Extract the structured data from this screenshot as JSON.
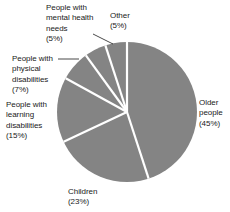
{
  "chart_data": {
    "type": "pie",
    "title": "",
    "subtitle": "",
    "xlabel": "",
    "ylabel": "",
    "legend_position": "none",
    "grid": false,
    "start_angle_deg": 0,
    "direction": "clockwise",
    "slice_fill_color": "#848484",
    "slice_separator_color": "#ffffff",
    "label_text_color": "#1a1a1a",
    "categories": [
      "Older people",
      "Children",
      "People with learning disabilities",
      "People with physical disabilities",
      "People with mental health needs",
      "Other"
    ],
    "values": [
      45,
      23,
      15,
      7,
      5,
      5
    ],
    "unit": "%",
    "slices": [
      {
        "name": "Older people",
        "value": 45,
        "value_label": "(45%)",
        "label_lines": [
          "Older",
          "people",
          "(45%)"
        ]
      },
      {
        "name": "Children",
        "value": 23,
        "value_label": "(23%)",
        "label_lines": [
          "Children",
          "(23%)"
        ]
      },
      {
        "name": "People with learning disabilities",
        "value": 15,
        "value_label": "(15%)",
        "label_lines": [
          "People with",
          "learning",
          "disabilities",
          "(15%)"
        ]
      },
      {
        "name": "People with physical disabilities",
        "value": 7,
        "value_label": "(7%)",
        "label_lines": [
          "People with",
          "physical",
          "disabilities",
          "(7%)"
        ]
      },
      {
        "name": "People with mental health needs",
        "value": 5,
        "value_label": "(5%)",
        "label_lines": [
          "People with",
          "mental health",
          "needs",
          "(5%)"
        ]
      },
      {
        "name": "Other",
        "value": 5,
        "value_label": "(5%)",
        "label_lines": [
          "Other",
          "(5%)"
        ]
      }
    ]
  },
  "labels": {
    "older": "Older\npeople\n(45%)",
    "children": "Children\n(23%)",
    "learning": "People with\nlearning\ndisabilities\n(15%)",
    "physical": "People with\nphysical\ndisabilities\n(7%)",
    "mental": "People with\nmental health\nneeds\n(5%)",
    "other": "Other\n(5%)"
  }
}
